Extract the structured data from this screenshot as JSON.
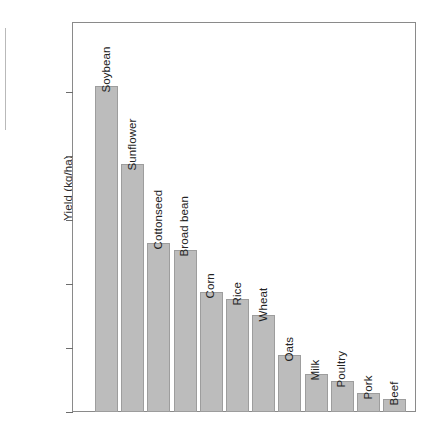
{
  "chart_data": {
    "type": "bar",
    "title": "",
    "subtitle": "",
    "xlabel": "",
    "ylabel": "Yield (kg/ha)",
    "ylim": [
      0,
      550
    ],
    "yticks": [
      0,
      100,
      200,
      300,
      400,
      500
    ],
    "ytick_labels": [
      "0",
      "100",
      "200",
      "300",
      "400",
      "500"
    ],
    "grid": false,
    "legend": null,
    "orientation": "vertical",
    "bar_color": "#bcbcbc",
    "bar_edge_color": "#9d9d9d",
    "categories": [
      "Soybean",
      "Sunflower",
      "Cottonseed",
      "Broad bean",
      "Corn",
      "Rice",
      "Wheat",
      "Oats",
      "Milk",
      "Poultry",
      "Pork",
      "Beef"
    ],
    "values": [
      510,
      388,
      264,
      253,
      187,
      177,
      152,
      89,
      60,
      48,
      30,
      20
    ],
    "label_rotation": 90,
    "labels_inside_plot": true
  },
  "axis": {
    "y_title": "Yield (kg/ha)"
  }
}
